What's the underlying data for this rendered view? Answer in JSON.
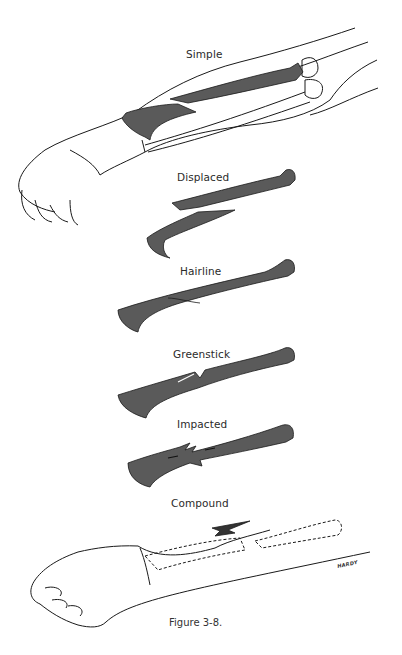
{
  "figure": {
    "caption": "Figure 3-8.",
    "signature": "HARDY",
    "colors": {
      "bone_fill": "#5a5a5a",
      "outline": "#1a1a1a",
      "background": "#ffffff"
    },
    "panels": [
      {
        "id": "simple",
        "label": "Simple"
      },
      {
        "id": "displaced",
        "label": "Displaced"
      },
      {
        "id": "hairline",
        "label": "Hairline"
      },
      {
        "id": "greenstick",
        "label": "Greenstick"
      },
      {
        "id": "impacted",
        "label": "Impacted"
      },
      {
        "id": "compound",
        "label": "Compound"
      }
    ]
  }
}
